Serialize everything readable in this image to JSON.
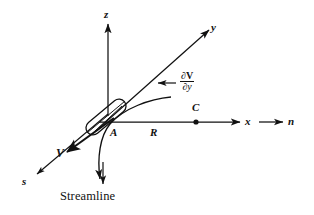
{
  "figure": {
    "type": "technical-line-diagram",
    "background_color": "#ffffff",
    "ink_color": "#111111"
  },
  "axes": [
    {
      "id": "z",
      "label": "z",
      "direction": "vertical-up",
      "from": [
        108,
        112
      ],
      "to": [
        108,
        22
      ],
      "arrow": true
    },
    {
      "id": "y",
      "label": "y",
      "direction": "upper-right",
      "from": [
        100,
        126
      ],
      "to": [
        211,
        28
      ],
      "arrow": true
    },
    {
      "id": "x",
      "label": "x",
      "direction": "right",
      "from": [
        100,
        122
      ],
      "to": [
        242,
        122
      ],
      "arrow": true
    },
    {
      "id": "s",
      "label": "s",
      "direction": "lower-left",
      "from": [
        110,
        112
      ],
      "to": [
        33,
        177
      ],
      "arrow": true
    },
    {
      "id": "n",
      "label": "n",
      "direction": "right",
      "from": [
        258,
        122
      ],
      "to": [
        284,
        122
      ],
      "arrow": true
    }
  ],
  "labels": {
    "z_axis": "z",
    "y_axis": "y",
    "x_axis": "x",
    "s_axis": "s",
    "n_axis": "n",
    "point_a": "A",
    "point_c": "C",
    "radius": "R",
    "velocity": "V",
    "streamline": "Streamline"
  },
  "derivative_label": {
    "numerator_partial": "∂",
    "numerator_variable": "V",
    "denominator_partial": "∂",
    "denominator_variable": "y",
    "full_text": "∂V/∂y",
    "arrow_direction": "left",
    "points_to": "y-axis"
  },
  "points": [
    {
      "name": "A",
      "label": "A",
      "kind": "fluid-element-origin",
      "x": 110,
      "y": 124,
      "marker": "none"
    },
    {
      "name": "C",
      "label": "C",
      "kind": "center-of-curvature",
      "x": 196,
      "y": 122,
      "marker": "filled-dot"
    }
  ],
  "segments": [
    {
      "name": "radius-R",
      "label": "R",
      "from": "A",
      "to": "C",
      "along": "x-axis"
    }
  ],
  "fluid_element": {
    "shape": "rounded-parallelogram",
    "description": "small elongated fluid element straddling point A, aligned with the streamline direction",
    "center": [
      107,
      116
    ],
    "angle_deg": -41
  },
  "streamline": {
    "description": "curved streamline passing through A, concave toward C, arrow pointing down-left",
    "arrow_at": [
      103,
      186
    ],
    "label": "Streamline",
    "label_position": [
      73,
      193
    ]
  },
  "velocity_vector": {
    "label": "V",
    "bold": true,
    "from": [
      113,
      119
    ],
    "to": [
      64,
      154
    ],
    "direction": "tangent-to-streamline-down-left"
  }
}
